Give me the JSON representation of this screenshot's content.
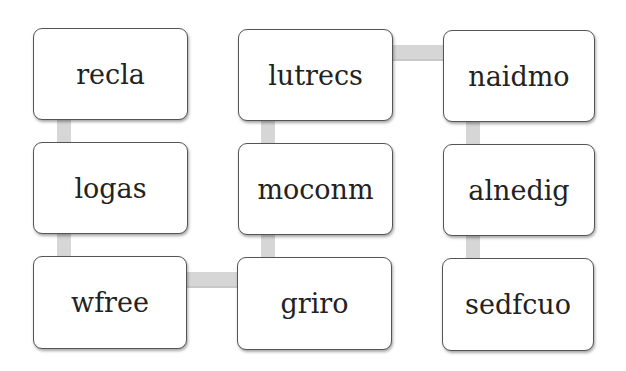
{
  "diagram": {
    "nodes": [
      {
        "id": "recla",
        "label": "recla",
        "row": 1,
        "col": 1
      },
      {
        "id": "lutrecs",
        "label": "lutrecs",
        "row": 1,
        "col": 2
      },
      {
        "id": "naidmo",
        "label": "naidmo",
        "row": 1,
        "col": 3
      },
      {
        "id": "logas",
        "label": "logas",
        "row": 2,
        "col": 1
      },
      {
        "id": "moconm",
        "label": "moconm",
        "row": 2,
        "col": 2
      },
      {
        "id": "alnedig",
        "label": "alnedig",
        "row": 2,
        "col": 3
      },
      {
        "id": "wfree",
        "label": "wfree",
        "row": 3,
        "col": 1
      },
      {
        "id": "griro",
        "label": "griro",
        "row": 3,
        "col": 2
      },
      {
        "id": "sedfcuo",
        "label": "sedfcuo",
        "row": 3,
        "col": 3
      }
    ],
    "edges": [
      {
        "from": "recla",
        "to": "logas"
      },
      {
        "from": "logas",
        "to": "wfree"
      },
      {
        "from": "wfree",
        "to": "griro"
      },
      {
        "from": "griro",
        "to": "moconm"
      },
      {
        "from": "moconm",
        "to": "lutrecs"
      },
      {
        "from": "lutrecs",
        "to": "naidmo"
      },
      {
        "from": "naidmo",
        "to": "alnedig"
      },
      {
        "from": "alnedig",
        "to": "sedfcuo"
      }
    ]
  }
}
